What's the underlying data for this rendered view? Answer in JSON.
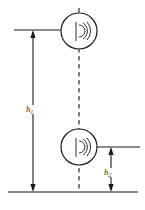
{
  "figure": {
    "background_color": "#ffffff",
    "stroke_color": "#1a1a1a",
    "width": 145,
    "height": 210
  },
  "dimensions": [
    {
      "id": "h1",
      "label": "h",
      "subscript": "1",
      "full_label": "h1",
      "orientation": "vertical",
      "arrow_style": "double-headed",
      "from": "upper reference line",
      "to": "ground line"
    },
    {
      "id": "h2",
      "label": "h",
      "subscript": "2",
      "full_label": "h2",
      "orientation": "vertical",
      "arrow_style": "double-headed",
      "from": "lower emitter centerline",
      "to": "ground line"
    }
  ],
  "nodes": [
    {
      "id": "emitter-upper",
      "icon": "signal-emitter-icon",
      "shape": "circle",
      "cx": 79,
      "cy": 31,
      "r": 18
    },
    {
      "id": "emitter-lower",
      "icon": "signal-emitter-icon",
      "shape": "circle",
      "cx": 79,
      "cy": 147,
      "r": 18
    }
  ],
  "reference_lines": [
    {
      "id": "upper-reference-line",
      "orientation": "horizontal",
      "y": 30,
      "x1": 14,
      "x2": 61
    },
    {
      "id": "lower-reference-line",
      "orientation": "horizontal",
      "y": 147,
      "x1": 97,
      "x2": 140
    },
    {
      "id": "ground-line",
      "orientation": "horizontal",
      "y": 192,
      "x1": 8,
      "x2": 138
    },
    {
      "id": "centerline",
      "orientation": "vertical",
      "style": "dashed",
      "x": 79,
      "y1": 8,
      "y2": 190
    }
  ]
}
